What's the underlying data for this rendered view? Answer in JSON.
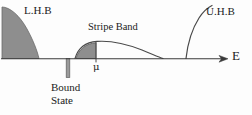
{
  "figure": {
    "kind": "density-of-states-schematic",
    "axis": {
      "label": "E",
      "label_name": "energy-axis-label",
      "orientation": "horizontal",
      "arrow": "right",
      "baseline_y": 59,
      "x_start": 2,
      "x_end": 228,
      "color": "#3a3a3a"
    },
    "labels": {
      "lower_hubbard_band": "L.H.B",
      "upper_hubbard_band": "U.H.B",
      "stripe_band": "Stripe Band",
      "chemical_potential": "μ",
      "bound_state_line1": "Bound",
      "bound_state_line2": "State"
    },
    "colors": {
      "fill_gray": "#8e8e8e",
      "fill_gray_light": "#9a9a9a",
      "stroke_dark": "#3a3a3a",
      "text": "#1b1b1b",
      "background": "#fdfdfd"
    },
    "features": [
      {
        "name": "lower-hubbard-band",
        "display": "L.H.B",
        "filled": true,
        "fill": "#8e8e8e",
        "x_left": 2,
        "x_right": 40,
        "peak_y": 8
      },
      {
        "name": "stripe-band",
        "display": "Stripe Band",
        "filled_portion": "left-of-mu",
        "fill": "#8e8e8e",
        "x_left": 74,
        "x_right": 163,
        "apex_x": 118,
        "apex_y": 38
      },
      {
        "name": "bound-state",
        "display": "Bound State",
        "shape": "vertical-bar-below-axis",
        "x": 68,
        "y_top": 59,
        "y_bottom": 78,
        "width": 4
      },
      {
        "name": "chemical-potential-marker",
        "display": "μ",
        "x": 96,
        "y": 59
      },
      {
        "name": "upper-hubbard-band",
        "display": "U.H.B",
        "filled": false,
        "x_foot": 186,
        "x_top": 212,
        "top_y": 6
      }
    ]
  }
}
